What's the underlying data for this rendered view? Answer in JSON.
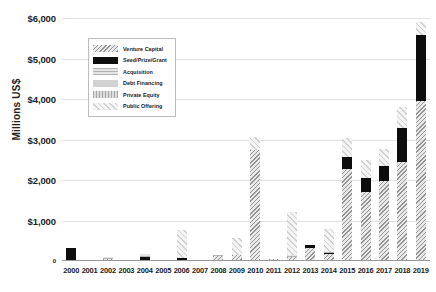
{
  "chart_data": {
    "type": "bar",
    "title": "",
    "subtitle": "",
    "xlabel": "",
    "ylabel": "Millions US$",
    "ylim": [
      0,
      6000
    ],
    "ytick_values": [
      0,
      1000,
      2000,
      3000,
      4000,
      5000,
      6000
    ],
    "ytick_labels": [
      "0",
      "$1,000",
      "$2,000",
      "$3,000",
      "$4,000",
      "$5,000",
      "$6,000"
    ],
    "grid": true,
    "stacked": true,
    "legend_position": "upper-left-inset",
    "categories": [
      "2000",
      "2001",
      "2002",
      "2003",
      "2004",
      "2005",
      "2006",
      "2007",
      "2008",
      "2009",
      "2010",
      "2011",
      "2012",
      "2013",
      "2014",
      "2015",
      "2016",
      "2017",
      "2018",
      "2019"
    ],
    "series": [
      {
        "name": "Venture Capital",
        "color": "#e9e9e9",
        "pattern": "diagonal-hatch",
        "values": [
          0,
          0,
          60,
          0,
          30,
          0,
          30,
          0,
          120,
          160,
          2750,
          60,
          110,
          330,
          170,
          2260,
          1700,
          1980,
          2440,
          3960
        ]
      },
      {
        "name": "Seed/Prize/Grant",
        "color": "#0d0d0d",
        "pattern": "solid-black",
        "values": [
          330,
          0,
          0,
          0,
          75,
          0,
          50,
          0,
          0,
          0,
          0,
          0,
          0,
          60,
          30,
          300,
          360,
          360,
          840,
          1610
        ]
      },
      {
        "name": "Acquisition",
        "color": "#e4e4e4",
        "pattern": "horizontal-lines",
        "values": [
          0,
          0,
          30,
          0,
          60,
          0,
          0,
          0,
          20,
          0,
          0,
          0,
          50,
          0,
          30,
          0,
          0,
          0,
          0,
          0
        ]
      },
      {
        "name": "Debt Financing",
        "color": "#d2d2d2",
        "pattern": "solid-grey",
        "values": [
          0,
          0,
          0,
          0,
          0,
          0,
          0,
          0,
          0,
          0,
          0,
          0,
          0,
          0,
          0,
          0,
          0,
          0,
          0,
          0
        ]
      },
      {
        "name": "Private Equity",
        "color": "#dcdcdc",
        "pattern": "vertical-lines",
        "values": [
          0,
          0,
          0,
          0,
          0,
          0,
          0,
          0,
          0,
          0,
          0,
          0,
          0,
          0,
          0,
          0,
          0,
          0,
          0,
          0
        ]
      },
      {
        "name": "Public Offering",
        "color": "#f4f4f4",
        "pattern": "fine-diagonal",
        "values": [
          0,
          0,
          0,
          0,
          0,
          0,
          680,
          0,
          0,
          420,
          300,
          0,
          1060,
          0,
          560,
          490,
          440,
          430,
          520,
          330
        ]
      }
    ],
    "totals": [
      330,
      0,
      90,
      0,
      165,
      0,
      760,
      0,
      140,
      580,
      3050,
      60,
      1220,
      390,
      790,
      3050,
      2500,
      2770,
      3800,
      5900
    ]
  },
  "legend": {
    "items": [
      {
        "label": "Venture Capital",
        "key": "venture-capital"
      },
      {
        "label": "Seed/Prize/Grant",
        "key": "seed-prize-grant"
      },
      {
        "label": "Acquisition",
        "key": "acquisition"
      },
      {
        "label": "Debt Financing",
        "key": "debt-financing"
      },
      {
        "label": "Private Equity",
        "key": "private-equity"
      },
      {
        "label": "Public Offering",
        "key": "public-offering"
      }
    ]
  }
}
